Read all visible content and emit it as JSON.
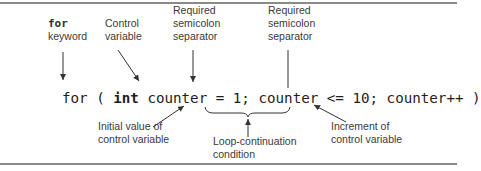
{
  "diagram": {
    "type": "annotated-code",
    "code": {
      "for": "for",
      "open_paren": " ( ",
      "int_kw": "int",
      "init": " counter = 1; ",
      "condition": "counter <= 10;",
      "increment": " counter++ )"
    },
    "annotations": {
      "for_keyword": {
        "line1": "for",
        "line2": "keyword"
      },
      "control_variable": {
        "line1": "Control",
        "line2": "variable"
      },
      "separator_1": {
        "line1": "Required",
        "line2": "semicolon",
        "line3": "separator"
      },
      "separator_2": {
        "line1": "Required",
        "line2": "semicolon",
        "line3": "separator"
      },
      "initial_value": {
        "line1": "Initial value of",
        "line2": "control variable"
      },
      "loop_condition": {
        "line1": "Loop-continuation",
        "line2": "condition"
      },
      "increment": {
        "line1": "Increment of",
        "line2": "control variable"
      }
    },
    "colors": {
      "text": "#3a3a3a",
      "code": "#1e1e1e",
      "rule": "#8a8a8a",
      "arrow": "#333333"
    }
  }
}
